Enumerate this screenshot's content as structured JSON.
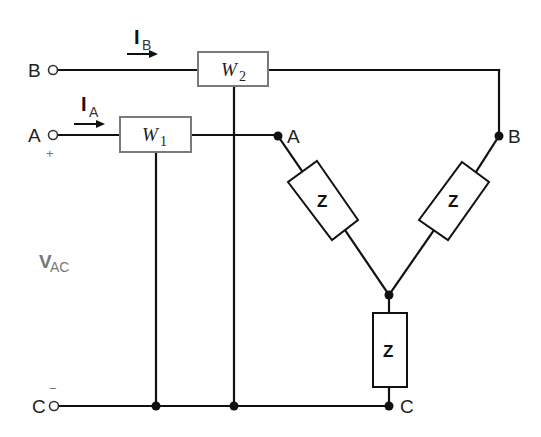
{
  "diagram": {
    "type": "three-phase two-wattmeter circuit with wye-connected load",
    "terminals": {
      "B": {
        "label": "B"
      },
      "A": {
        "label": "A",
        "polarity": "+"
      },
      "C": {
        "label": "C",
        "polarity": "−"
      }
    },
    "currents": {
      "IB": {
        "main": "I",
        "sub": "B"
      },
      "IA": {
        "main": "I",
        "sub": "A"
      }
    },
    "voltage": {
      "main": "V",
      "sub": "AC"
    },
    "wattmeters": [
      {
        "main": "W",
        "sub": "2"
      },
      {
        "main": "W",
        "sub": "1"
      }
    ],
    "load_nodes": {
      "A": "A",
      "B": "B",
      "C": "C"
    },
    "impedances": [
      {
        "label": "Z"
      },
      {
        "label": "Z"
      },
      {
        "label": "Z"
      }
    ],
    "colors": {
      "wire": "#111111",
      "meter_border": "#7a7a7a",
      "voltage_label": "#777777"
    }
  }
}
